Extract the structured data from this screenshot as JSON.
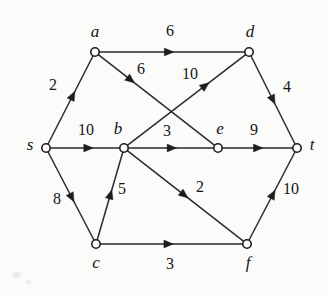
{
  "figure": {
    "background_color": "#fbfbf9",
    "ink_color": "#1d1d1d",
    "width": 328,
    "height": 296
  },
  "chart_data": {
    "type": "diagram",
    "diagram_kind": "directed-weighted-graph",
    "grid": false,
    "legend": null,
    "source_node": "s",
    "sink_node": "t",
    "nodes": [
      {
        "id": "s",
        "label": "s",
        "x": 46,
        "y": 148,
        "label_x": 30,
        "label_y": 146
      },
      {
        "id": "a",
        "label": "a",
        "x": 95,
        "y": 52,
        "label_x": 95,
        "label_y": 33
      },
      {
        "id": "b",
        "label": "b",
        "x": 124,
        "y": 148,
        "label_x": 118,
        "label_y": 130
      },
      {
        "id": "c",
        "label": "c",
        "x": 96,
        "y": 244,
        "label_x": 96,
        "label_y": 264
      },
      {
        "id": "d",
        "label": "d",
        "x": 249,
        "y": 52,
        "label_x": 250,
        "label_y": 33
      },
      {
        "id": "e",
        "label": "e",
        "x": 218,
        "y": 148,
        "label_x": 220,
        "label_y": 130
      },
      {
        "id": "f",
        "label": "f",
        "x": 247,
        "y": 244,
        "label_x": 248,
        "label_y": 264
      },
      {
        "id": "t",
        "label": "t",
        "x": 297,
        "y": 148,
        "label_x": 312,
        "label_y": 146
      }
    ],
    "edges": [
      {
        "from": "s",
        "to": "a",
        "weight": 2,
        "label_x": 53,
        "label_y": 86,
        "arrow_t": 0.55
      },
      {
        "from": "s",
        "to": "b",
        "weight": 10,
        "label_x": 86,
        "label_y": 131,
        "arrow_t": 0.55
      },
      {
        "from": "s",
        "to": "c",
        "weight": 8,
        "label_x": 57,
        "label_y": 200,
        "arrow_t": 0.52
      },
      {
        "from": "a",
        "to": "d",
        "weight": 6,
        "label_x": 170,
        "label_y": 32,
        "arrow_t": 0.48
      },
      {
        "from": "a",
        "to": "e",
        "weight": 6,
        "label_x": 141,
        "label_y": 70,
        "arrow_t": 0.28
      },
      {
        "from": "b",
        "to": "d",
        "weight": 10,
        "label_x": 190,
        "label_y": 75,
        "arrow_t": 0.66
      },
      {
        "from": "b",
        "to": "e",
        "weight": 3,
        "label_x": 167,
        "label_y": 132,
        "arrow_t": 0.51
      },
      {
        "from": "b",
        "to": "f",
        "weight": 2,
        "label_x": 200,
        "label_y": 188,
        "arrow_t": 0.49
      },
      {
        "from": "c",
        "to": "b",
        "weight": 5,
        "label_x": 122,
        "label_y": 190,
        "arrow_t": 0.52
      },
      {
        "from": "c",
        "to": "f",
        "weight": 3,
        "label_x": 170,
        "label_y": 265,
        "arrow_t": 0.48
      },
      {
        "from": "d",
        "to": "t",
        "weight": 4,
        "label_x": 287,
        "label_y": 88,
        "arrow_t": 0.5
      },
      {
        "from": "e",
        "to": "t",
        "weight": 9,
        "label_x": 254,
        "label_y": 131,
        "arrow_t": 0.51
      },
      {
        "from": "f",
        "to": "t",
        "weight": 10,
        "label_x": 291,
        "label_y": 190,
        "arrow_t": 0.52
      }
    ]
  }
}
